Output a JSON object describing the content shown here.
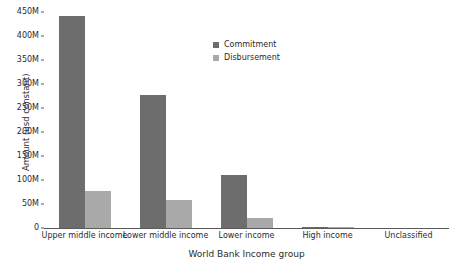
{
  "chart_data": {
    "type": "bar",
    "title": "",
    "xlabel": "World Bank Income group",
    "ylabel": "Amount (usd constant)",
    "categories": [
      "Upper middle income",
      "Lower middle income",
      "Lower income",
      "High income",
      "Unclassified"
    ],
    "series": [
      {
        "name": "Commitment",
        "color": "#6d6d6d",
        "values": [
          443000000,
          277000000,
          110000000,
          1500000,
          0
        ]
      },
      {
        "name": "Disbursement",
        "color": "#a9a9a9",
        "values": [
          78000000,
          58000000,
          20000000,
          700000,
          0
        ]
      }
    ],
    "ylim": [
      0,
      455000000
    ],
    "yticks": [
      0,
      50000000,
      100000000,
      150000000,
      200000000,
      250000000,
      300000000,
      350000000,
      400000000,
      450000000
    ],
    "ytick_labels": [
      "0",
      "50M",
      "100M",
      "150M",
      "200M",
      "250M",
      "300M",
      "350M",
      "400M",
      "450M"
    ],
    "grid": false,
    "legend_position": "upper-center-inside"
  },
  "legend": {
    "entries": [
      {
        "label": "Commitment",
        "color": "#6d6d6d"
      },
      {
        "label": "Disbursement",
        "color": "#a9a9a9"
      }
    ]
  },
  "colors": {
    "background": "#ffffff",
    "axis": "#5a5a5a",
    "text": "#2b2b2b",
    "commitment": "#6d6d6d",
    "disbursement": "#a9a9a9"
  }
}
